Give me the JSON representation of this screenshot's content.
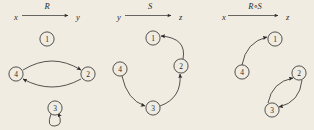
{
  "figure": {
    "background_color": "#f1ece2",
    "ink_color": "#2b2b2b",
    "kind": "relation-digraphs"
  },
  "panels": [
    {
      "id": "R",
      "header": {
        "domain": "x",
        "relation": "R",
        "codomain": "y",
        "arrow": "right-arrow"
      },
      "nodes": [
        {
          "label": "1",
          "cx": 47,
          "cy": 39
        },
        {
          "label": "2",
          "cx": 88,
          "cy": 74
        },
        {
          "label": "4",
          "cx": 16,
          "cy": 74
        },
        {
          "label": "3",
          "cx": 55,
          "cy": 108
        }
      ],
      "edges": [
        {
          "from": "4",
          "to": "2",
          "style": "curve-up"
        },
        {
          "from": "2",
          "to": "4",
          "style": "curve-down"
        },
        {
          "from": "3",
          "to": "3",
          "style": "self-loop"
        }
      ]
    },
    {
      "id": "S",
      "header": {
        "domain": "y",
        "relation": "S",
        "codomain": "z",
        "arrow": "right-arrow"
      },
      "nodes": [
        {
          "label": "1",
          "cx": 48,
          "cy": 38
        },
        {
          "label": "2",
          "cx": 76,
          "cy": 66
        },
        {
          "label": "4",
          "cx": 15,
          "cy": 69
        },
        {
          "label": "3",
          "cx": 48,
          "cy": 108
        }
      ],
      "edges": [
        {
          "from": "2",
          "to": "1",
          "style": "curve"
        },
        {
          "from": "3",
          "to": "2",
          "style": "curve"
        },
        {
          "from": "4",
          "to": "3",
          "style": "curve"
        }
      ]
    },
    {
      "id": "RS",
      "header": {
        "domain": "x",
        "relation": "R∘S",
        "codomain": "z",
        "arrow": "right-arrow"
      },
      "nodes": [
        {
          "label": "1",
          "cx": 65,
          "cy": 39
        },
        {
          "label": "2",
          "cx": 89,
          "cy": 73
        },
        {
          "label": "4",
          "cx": 32,
          "cy": 72
        },
        {
          "label": "3",
          "cx": 62,
          "cy": 110
        }
      ],
      "edges": [
        {
          "from": "4",
          "to": "1",
          "style": "curve"
        },
        {
          "from": "3",
          "to": "2",
          "style": "curve-left"
        },
        {
          "from": "2",
          "to": "3",
          "style": "curve-right"
        }
      ]
    }
  ]
}
